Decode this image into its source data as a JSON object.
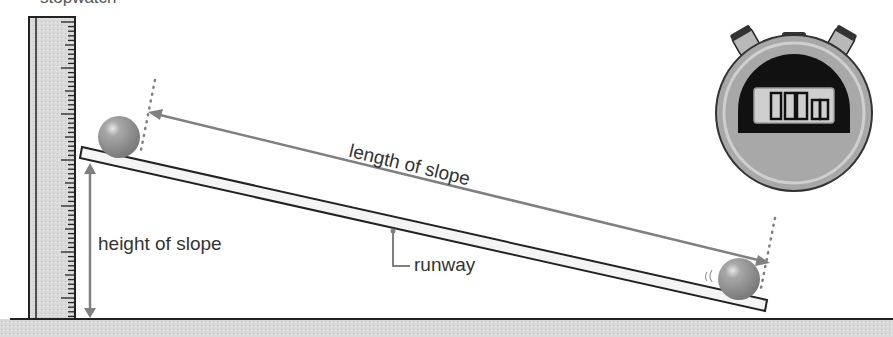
{
  "diagram": {
    "cropped_caption": "stopwatch",
    "labels": {
      "length": "length of slope",
      "height": "height of slope",
      "runway": "runway"
    },
    "stopwatch": {
      "display": "0:00"
    },
    "colors": {
      "arrow": "#808080",
      "outline": "#222222",
      "ruler_fill": "#dcdcdc",
      "ground": "#d6d6d6",
      "ball": "#9a9a9a",
      "stopwatch_body": "#a8a8a8",
      "screen_bg": "#111111",
      "lcd": "#cfcfcf"
    }
  }
}
